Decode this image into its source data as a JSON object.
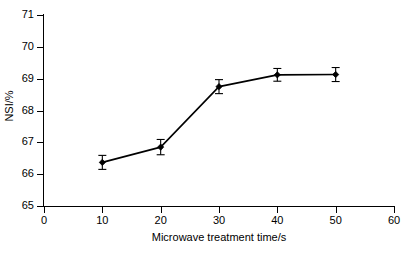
{
  "chart_data": {
    "type": "line",
    "title": "",
    "xlabel": "Microwave treatment time/s",
    "ylabel": "NSI/%",
    "x": [
      10,
      20,
      30,
      40,
      50
    ],
    "values": [
      66.37,
      66.85,
      68.75,
      69.12,
      69.13
    ],
    "errors": [
      0.22,
      0.24,
      0.22,
      0.2,
      0.22
    ],
    "xlim": [
      0,
      60
    ],
    "ylim": [
      65,
      71
    ],
    "xticks": [
      0,
      10,
      20,
      30,
      40,
      50,
      60
    ],
    "yticks": [
      65,
      66,
      67,
      68,
      69,
      70,
      71
    ],
    "xtick_labels": [
      "0",
      "10",
      "20",
      "30",
      "40",
      "50",
      "60"
    ],
    "ytick_labels": [
      "65",
      "66",
      "67",
      "68",
      "69",
      "70",
      "71"
    ],
    "grid": false,
    "legend": null,
    "series_color": "#000000",
    "marker": "filled-diamond",
    "error_bar_style": "capped",
    "annotations": []
  }
}
